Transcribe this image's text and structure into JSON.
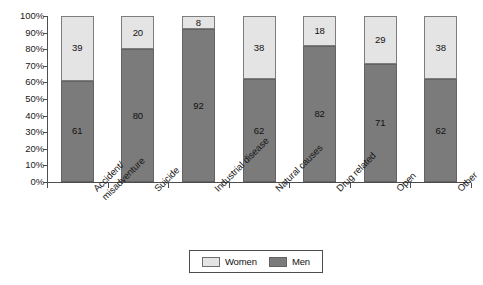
{
  "chart_data": {
    "type": "bar",
    "subtype": "stacked-100-percent",
    "title": "",
    "xlabel": "",
    "ylabel": "",
    "ylim": [
      0,
      100
    ],
    "grid": false,
    "legend_position": "bottom-center",
    "categories": [
      "Accident/\nmisadventure",
      "Suicide",
      "Industrial disease",
      "Natural causes",
      "Drug related",
      "Open",
      "Other"
    ],
    "category_lines": [
      [
        "Accident/",
        "misadventure"
      ],
      [
        "Suicide"
      ],
      [
        "Industrial disease"
      ],
      [
        "Natural causes"
      ],
      [
        "Drug related"
      ],
      [
        "Open"
      ],
      [
        "Other"
      ]
    ],
    "series": [
      {
        "name": "Women",
        "color": "#e4e4e4",
        "values": [
          39,
          20,
          8,
          38,
          18,
          29,
          38
        ]
      },
      {
        "name": "Men",
        "color": "#7b7b7b",
        "values": [
          61,
          80,
          92,
          62,
          82,
          71,
          62
        ]
      }
    ],
    "ytick_labels": [
      "100%",
      "90%",
      "80%",
      "70%",
      "60%",
      "50%",
      "40%",
      "30%",
      "20%",
      "10%",
      "0%"
    ],
    "ytick_values": [
      100,
      90,
      80,
      70,
      60,
      50,
      40,
      30,
      20,
      10,
      0
    ]
  },
  "legend": {
    "entries": [
      {
        "label": "Women",
        "swatch": "women"
      },
      {
        "label": "Men",
        "swatch": "men"
      }
    ]
  }
}
